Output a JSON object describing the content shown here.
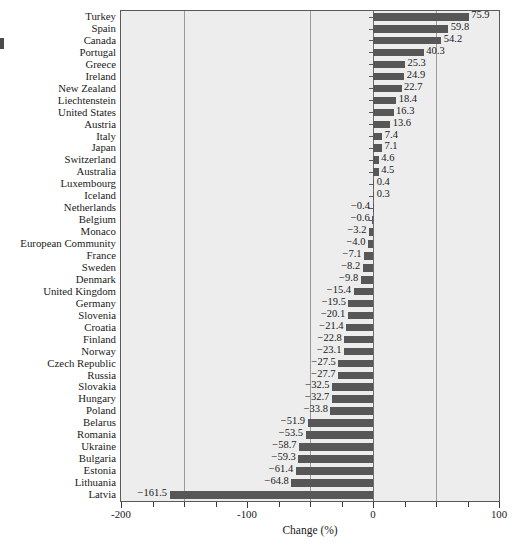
{
  "chart_data": {
    "type": "bar",
    "orientation": "horizontal",
    "title": "",
    "xlabel": "Change (%)",
    "ylabel": "",
    "xlim": [
      -200,
      100
    ],
    "xticks": [
      -200,
      -175,
      -150,
      -125,
      -100,
      -75,
      -50,
      -25,
      0,
      25,
      50,
      75,
      100
    ],
    "xticklabels": [
      "-200",
      "",
      "",
      "",
      "-100",
      "",
      "",
      "",
      "0",
      "",
      "",
      "",
      "100"
    ],
    "gridlines": [
      -150,
      -50,
      50
    ],
    "grid": true,
    "legend": null,
    "categories": [
      "Turkey",
      "Spain",
      "Canada",
      "Portugal",
      "Greece",
      "Ireland",
      "New Zealand",
      "Liechtenstein",
      "United States",
      "Austria",
      "Italy",
      "Japan",
      "Switzerland",
      "Australia",
      "Luxembourg",
      "Iceland",
      "Netherlands",
      "Belgium",
      "Monaco",
      "European Community",
      "France",
      "Sweden",
      "Denmark",
      "United Kingdom",
      "Germany",
      "Slovenia",
      "Croatia",
      "Finland",
      "Norway",
      "Czech Republic",
      "Russia",
      "Slovakia",
      "Hungary",
      "Poland",
      "Belarus",
      "Romania",
      "Ukraine",
      "Bulgaria",
      "Estonia",
      "Lithuania",
      "Latvia"
    ],
    "values": [
      75.9,
      59.8,
      54.2,
      40.3,
      25.3,
      24.9,
      22.7,
      18.4,
      16.3,
      13.6,
      7.4,
      7.1,
      4.6,
      4.5,
      0.4,
      0.3,
      -0.4,
      -0.6,
      -3.2,
      -4.0,
      -7.1,
      -8.2,
      -9.8,
      -15.4,
      -19.5,
      -20.1,
      -21.4,
      -22.8,
      -23.1,
      -27.5,
      -27.7,
      -32.5,
      -32.7,
      -33.8,
      -51.9,
      -53.5,
      -58.7,
      -59.3,
      -61.4,
      -64.8,
      -161.5
    ],
    "value_labels": [
      "75.9",
      "59.8",
      "54.2",
      "40.3",
      "25.3",
      "24.9",
      "22.7",
      "18.4",
      "16.3",
      "13.6",
      "7.4",
      "7.1",
      "4.6",
      "4.5",
      "0.4",
      "0.3",
      "−0.4",
      "−0.6",
      "−3.2",
      "−4.0",
      "−7.1",
      "−8.2",
      "−9.8",
      "−15.4",
      "−19.5",
      "−20.1",
      "−21.4",
      "−22.8",
      "−23.1",
      "−27.5",
      "−27.7",
      "−32.5",
      "−32.7",
      "−33.8",
      "−51.9",
      "−53.5",
      "−58.7",
      "−59.3",
      "−61.4",
      "−64.8",
      "−161.5"
    ],
    "bar_color": "#575757",
    "plot_background": "#ededed",
    "gridline_color": "#9a9a9a"
  },
  "axis": {
    "x_title": "Change (%)",
    "x_tick_labels": {
      "neg200": "−200",
      "neg100": "−100",
      "zero": "0",
      "pos100": "100"
    }
  }
}
